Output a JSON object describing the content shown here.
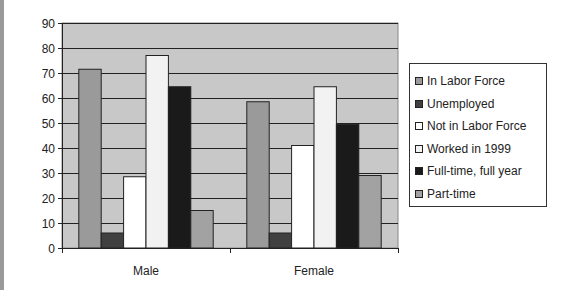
{
  "chart_data": {
    "type": "bar",
    "title": "",
    "xlabel": "",
    "ylabel": "",
    "categories": [
      "Male",
      "Female"
    ],
    "series": [
      {
        "name": "In Labor Force",
        "values": [
          71.5,
          58.5
        ],
        "color": "#9a9a9a"
      },
      {
        "name": "Unemployed",
        "values": [
          6,
          6
        ],
        "color": "#404040"
      },
      {
        "name": "Not in Labor Force",
        "values": [
          28.5,
          41
        ],
        "color": "#ffffff"
      },
      {
        "name": "Worked in 1999",
        "values": [
          77,
          64.5
        ],
        "color": "#f2f2f2"
      },
      {
        "name": "Full-time, full year",
        "values": [
          64.5,
          49.5
        ],
        "color": "#1a1a1a"
      },
      {
        "name": "Part-time",
        "values": [
          15,
          29
        ],
        "color": "#a2a2a2"
      }
    ],
    "ylim": [
      0,
      90
    ],
    "yticks": [
      0,
      10,
      20,
      30,
      40,
      50,
      60,
      70,
      80,
      90
    ],
    "grid": true,
    "plot_background": "#c8c8c8",
    "legend_position": "right"
  }
}
